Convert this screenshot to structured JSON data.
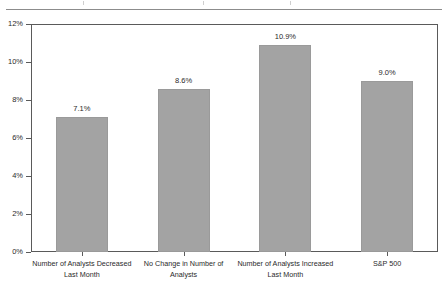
{
  "chart_data": {
    "type": "bar",
    "title": "",
    "subtitle": "",
    "xlabel": "",
    "ylabel": "",
    "ylim": [
      0,
      12
    ],
    "ytick_labels": [
      "0%",
      "2%",
      "4%",
      "6%",
      "8%",
      "10%",
      "12%"
    ],
    "ytick_values": [
      0,
      2,
      4,
      6,
      8,
      10,
      12
    ],
    "grid": false,
    "legend": null,
    "categories": [
      "Number of Analysts Decreased Last Month",
      "No Change in Number of Analysts",
      "Number of Analysts Increased Last Month",
      "S&P 500"
    ],
    "category_lines": [
      [
        "Number of Analysts Decreased",
        "Last Month"
      ],
      [
        "No Change in Number of",
        "Analysts"
      ],
      [
        "Number of Analysts Increased",
        "Last Month"
      ],
      [
        "S&P 500"
      ]
    ],
    "values": [
      7.1,
      8.6,
      10.9,
      9.0
    ],
    "data_labels": [
      "7.1%",
      "8.6%",
      "10.9%",
      "9.0%"
    ],
    "bar_color": "#a3a3a3",
    "axis_color": "#5a5a5a",
    "text_color": "#2a2a2a",
    "background_color": "#ffffff"
  }
}
